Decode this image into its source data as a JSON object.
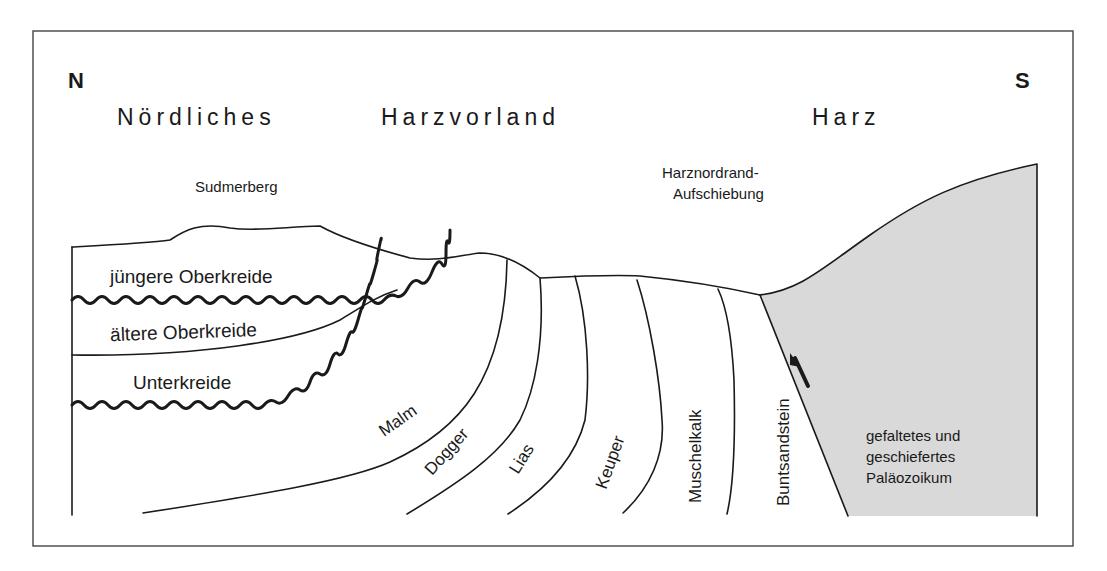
{
  "diagram": {
    "type": "geological-cross-section",
    "orientation": {
      "left": "N",
      "right": "S"
    },
    "regions": [
      {
        "id": "region1",
        "label": "Nördliches"
      },
      {
        "id": "region2",
        "label": "Harzvorland"
      },
      {
        "id": "region3",
        "label": "Harz"
      }
    ],
    "features": {
      "hill": "Sudmerberg",
      "fault_line1": "Harznordrand-",
      "fault_line2": "Aufschiebung"
    },
    "units": {
      "juengere_oberkreide": "jüngere Oberkreide",
      "aeltere_oberkreide": "ältere Oberkreide",
      "unterkreide": "Unterkreide",
      "malm": "Malm",
      "dogger": "Dogger",
      "lias": "Lias",
      "keuper": "Keuper",
      "muschelkalk": "Muschelkalk",
      "buntsandstein": "Buntsandstein",
      "palaeozoikum_line1": "gefaltetes und",
      "palaeozoikum_line2": "geschiefertes",
      "palaeozoikum_line3": "Paläozoikum"
    },
    "colors": {
      "palaeozoic_fill": "#d9d9d9",
      "line": "#1a1a1a",
      "frame": "#444444",
      "background": "#ffffff"
    }
  }
}
